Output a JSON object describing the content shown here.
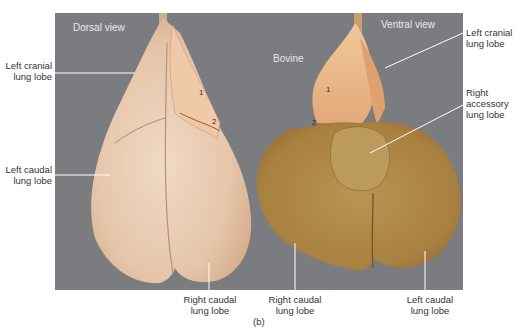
{
  "figure": {
    "caption": "(b)",
    "species_label": "Bovine",
    "dorsal_view_label": "Dorsal view",
    "ventral_view_label": "Ventral view",
    "colors": {
      "background_photo": "#7a7c80",
      "dorsal_lung": "#e9cdb4",
      "ventral_lung": "#b08a4e",
      "leader_line": "#ffffff",
      "label_text": "#333333"
    },
    "callouts": {
      "dorsal_left_cranial": {
        "line1": "Left cranial",
        "line2": "lung lobe"
      },
      "dorsal_left_caudal": {
        "line1": "Left caudal",
        "line2": "lung lobe"
      },
      "dorsal_right_caudal": {
        "line1": "Right caudal",
        "line2": "lung lobe"
      },
      "ventral_left_cranial": {
        "line1": "Left cranial",
        "line2": "lung lobe"
      },
      "ventral_right_accessory": {
        "line1": "Right",
        "line2": "accessory",
        "line3": "lung lobe"
      },
      "ventral_right_caudal": {
        "line1": "Right caudal",
        "line2": "lung lobe"
      },
      "ventral_left_caudal": {
        "line1": "Left caudal",
        "line2": "lung lobe"
      }
    },
    "markers": {
      "dorsal_1": "1",
      "dorsal_2": "2",
      "ventral_1": "1",
      "ventral_2": "2"
    }
  }
}
